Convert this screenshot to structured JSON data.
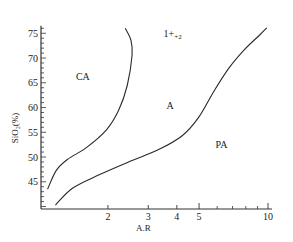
{
  "chart_data": {
    "type": "line",
    "title": "",
    "xlabel": "A.R",
    "ylabel": "SiO₂(%)",
    "x_scale": "log",
    "xlim": [
      1.0,
      11.0
    ],
    "ylim": [
      39.5,
      76.5
    ],
    "x_ticks_major": [
      2,
      3,
      4,
      5,
      10
    ],
    "x_ticks_minor": [
      6,
      7,
      8,
      9
    ],
    "x_tick_labels": [
      "2",
      "3",
      "4",
      "5",
      "10"
    ],
    "y_ticks": [
      45,
      50,
      55,
      60,
      65,
      70,
      75
    ],
    "y_tick_labels": [
      "45",
      "50",
      "55",
      "60",
      "65",
      "70",
      "75"
    ],
    "y_minor_step": 1,
    "grid": false,
    "legend": null,
    "region_labels": [
      {
        "text": "CA",
        "x": 1.45,
        "y": 65.5
      },
      {
        "text": "A",
        "x": 3.6,
        "y": 59.8
      },
      {
        "text": "PA",
        "x": 5.9,
        "y": 51.9
      },
      {
        "text": "1+",
        "sub": "+2",
        "x": 3.5,
        "y": 74.2
      }
    ],
    "series": [
      {
        "name": "CA-A boundary",
        "x": [
          1.09,
          1.19,
          1.33,
          1.61,
          1.97,
          2.23,
          2.43,
          2.55,
          2.52,
          2.38
        ],
        "y": [
          43.5,
          47.3,
          49.5,
          51.9,
          55.5,
          59.5,
          64.5,
          70.6,
          73.6,
          76.0
        ]
      },
      {
        "name": "A-PA boundary",
        "x": [
          1.18,
          1.4,
          1.83,
          2.46,
          3.33,
          4.22,
          4.96,
          5.79,
          6.76,
          7.89,
          9.22,
          9.88
        ],
        "y": [
          40.3,
          43.7,
          46.4,
          49.0,
          51.5,
          54.3,
          57.9,
          63.2,
          68.0,
          71.7,
          74.7,
          76.1
        ]
      }
    ]
  }
}
